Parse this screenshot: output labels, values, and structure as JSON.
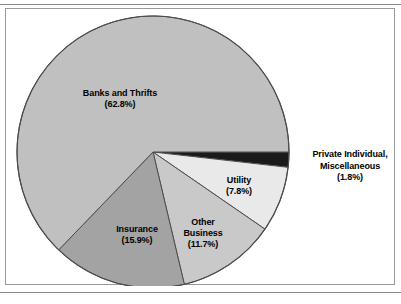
{
  "figure": {
    "frame_border_color": "#9a9a9a",
    "rule_color": "#8a8a8a",
    "background": "#ffffff"
  },
  "chart_data": {
    "type": "pie",
    "title": "",
    "subtitle": "",
    "xlabel": "",
    "ylabel": "",
    "legend_position": "none",
    "grid": false,
    "label_format": "name newline (percent%)",
    "total_percent": 100.0,
    "start_angle_deg": 0,
    "direction": "clockwise",
    "categories": [
      "Private Individual, Miscellaneous",
      "Utility",
      "Other Business",
      "Insurance",
      "Banks and Thrifts"
    ],
    "values": [
      1.8,
      7.8,
      11.7,
      15.9,
      62.8
    ],
    "slices": [
      {
        "name": "Private Individual, Miscellaneous",
        "name_line_1": "Private Individual,",
        "name_line_2": "Miscellaneous",
        "percent": 1.8,
        "percent_label": "(1.8%)",
        "color": "#1a1a1a",
        "label_placement": "outside-right",
        "start_deg": 0.0,
        "end_deg": 6.48
      },
      {
        "name": "Utility",
        "percent": 7.8,
        "percent_label": "(7.8%)",
        "color": "#e9e9e9",
        "label_placement": "inside",
        "start_deg": 6.48,
        "end_deg": 34.56
      },
      {
        "name": "Other Business",
        "name_line_1": "Other",
        "name_line_2": "Business",
        "percent": 11.7,
        "percent_label": "(11.7%)",
        "color": "#c9c9c9",
        "label_placement": "inside",
        "start_deg": 34.56,
        "end_deg": 76.68
      },
      {
        "name": "Insurance",
        "percent": 15.9,
        "percent_label": "(15.9%)",
        "color": "#a3a3a3",
        "label_placement": "inside",
        "start_deg": 76.68,
        "end_deg": 133.92
      },
      {
        "name": "Banks and Thrifts",
        "percent": 62.8,
        "percent_label": "(62.8%)",
        "color": "#c0c0c0",
        "label_placement": "inside",
        "start_deg": 133.92,
        "end_deg": 360.0
      }
    ],
    "geometry": {
      "center_x": 153,
      "center_y": 152,
      "radius": 136,
      "outline_color": "#4d4d4d"
    }
  }
}
